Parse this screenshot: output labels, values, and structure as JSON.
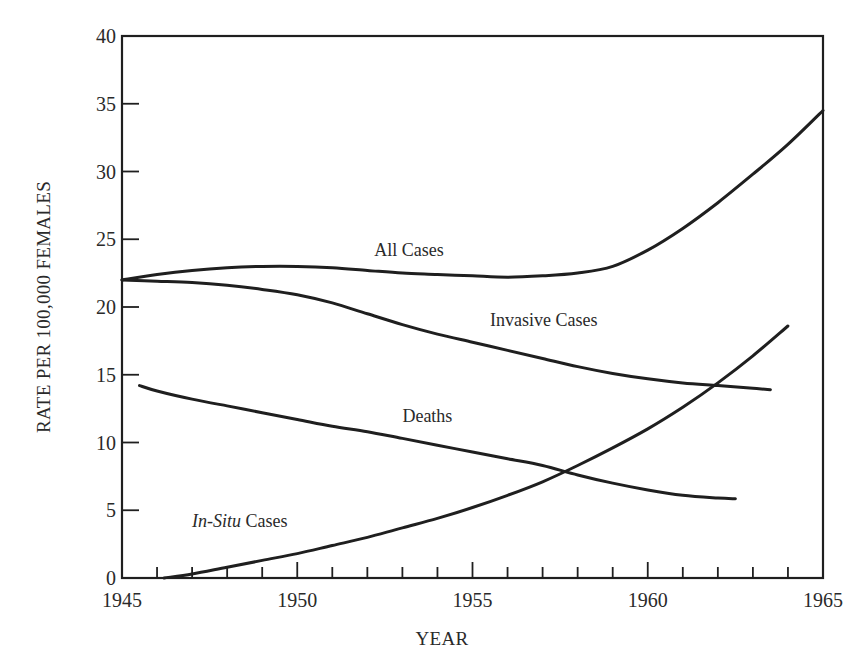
{
  "chart_data": {
    "type": "line",
    "title": "",
    "xlabel": "YEAR",
    "ylabel": "RATE PER 100,000 FEMALES",
    "xlim": [
      1945,
      1965
    ],
    "ylim": [
      0,
      40
    ],
    "x_ticks_major": [
      1945,
      1950,
      1955,
      1960,
      1965
    ],
    "x_ticks_minor_step": 1,
    "y_ticks": [
      0,
      5,
      10,
      15,
      20,
      25,
      30,
      35,
      40
    ],
    "grid": false,
    "legend": "inline labels",
    "series": [
      {
        "name": "All Cases",
        "label": "All Cases",
        "label_pos": [
          1952.2,
          23.8
        ],
        "italic_part": "",
        "points": [
          [
            1945,
            22.0
          ],
          [
            1946,
            22.4
          ],
          [
            1947,
            22.7
          ],
          [
            1948,
            22.9
          ],
          [
            1949,
            23.0
          ],
          [
            1950,
            23.0
          ],
          [
            1951,
            22.9
          ],
          [
            1952,
            22.7
          ],
          [
            1953,
            22.5
          ],
          [
            1954,
            22.4
          ],
          [
            1955,
            22.3
          ],
          [
            1956,
            22.2
          ],
          [
            1957,
            22.3
          ],
          [
            1958,
            22.5
          ],
          [
            1959,
            23.0
          ],
          [
            1960,
            24.2
          ],
          [
            1961,
            25.8
          ],
          [
            1962,
            27.7
          ],
          [
            1963,
            29.8
          ],
          [
            1964,
            32.0
          ],
          [
            1965,
            34.5
          ]
        ]
      },
      {
        "name": "Invasive Cases",
        "label": "Invasive Cases",
        "label_pos": [
          1955.5,
          18.6
        ],
        "italic_part": "",
        "points": [
          [
            1945,
            22.0
          ],
          [
            1946,
            21.9
          ],
          [
            1947,
            21.8
          ],
          [
            1948,
            21.6
          ],
          [
            1949,
            21.3
          ],
          [
            1950,
            20.9
          ],
          [
            1951,
            20.3
          ],
          [
            1952,
            19.5
          ],
          [
            1953,
            18.7
          ],
          [
            1954,
            18.0
          ],
          [
            1955,
            17.4
          ],
          [
            1956,
            16.8
          ],
          [
            1957,
            16.2
          ],
          [
            1958,
            15.6
          ],
          [
            1959,
            15.1
          ],
          [
            1960,
            14.7
          ],
          [
            1961,
            14.4
          ],
          [
            1962,
            14.2
          ],
          [
            1963,
            14.0
          ],
          [
            1963.5,
            13.9
          ]
        ]
      },
      {
        "name": "Deaths",
        "label": "Deaths",
        "label_pos": [
          1953.0,
          11.5
        ],
        "italic_part": "",
        "points": [
          [
            1945.5,
            14.2
          ],
          [
            1946,
            13.8
          ],
          [
            1947,
            13.2
          ],
          [
            1948,
            12.7
          ],
          [
            1949,
            12.2
          ],
          [
            1950,
            11.7
          ],
          [
            1951,
            11.2
          ],
          [
            1952,
            10.8
          ],
          [
            1953,
            10.3
          ],
          [
            1954,
            9.8
          ],
          [
            1955,
            9.3
          ],
          [
            1956,
            8.8
          ],
          [
            1957,
            8.3
          ],
          [
            1958,
            7.6
          ],
          [
            1959,
            7.0
          ],
          [
            1960,
            6.5
          ],
          [
            1961,
            6.1
          ],
          [
            1962,
            5.9
          ],
          [
            1962.5,
            5.85
          ]
        ]
      },
      {
        "name": "In-Situ Cases",
        "label": "Cases",
        "label_pos": [
          1947.0,
          3.8
        ],
        "italic_part": "In-Situ",
        "points": [
          [
            1946.2,
            0.0
          ],
          [
            1947,
            0.3
          ],
          [
            1948,
            0.8
          ],
          [
            1949,
            1.3
          ],
          [
            1950,
            1.8
          ],
          [
            1951,
            2.4
          ],
          [
            1952,
            3.0
          ],
          [
            1953,
            3.7
          ],
          [
            1954,
            4.4
          ],
          [
            1955,
            5.2
          ],
          [
            1956,
            6.1
          ],
          [
            1957,
            7.1
          ],
          [
            1958,
            8.3
          ],
          [
            1959,
            9.6
          ],
          [
            1960,
            11.0
          ],
          [
            1961,
            12.6
          ],
          [
            1962,
            14.4
          ],
          [
            1963,
            16.4
          ],
          [
            1964,
            18.6
          ]
        ]
      }
    ]
  },
  "axes": {
    "x_label": "YEAR",
    "y_label": "RATE PER 100,000 FEMALES",
    "x_tick_labels": [
      "1945",
      "1950",
      "1955",
      "1960",
      "1965"
    ],
    "y_tick_labels": [
      "0",
      "5",
      "10",
      "15",
      "20",
      "25",
      "30",
      "35",
      "40"
    ]
  },
  "colors": {
    "line": "#1f1f1f",
    "text": "#2a2a2a",
    "background": "#ffffff"
  }
}
